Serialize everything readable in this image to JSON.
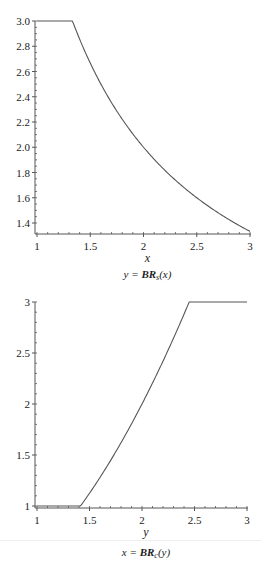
{
  "chart_data": [
    {
      "type": "line",
      "title": "",
      "caption_lhs": "y = ",
      "caption_fn": "BR",
      "caption_sub": "s",
      "caption_arg": "(x)",
      "xlabel": "x",
      "ylabel": "",
      "xlim": [
        1,
        3
      ],
      "ylim": [
        1.333,
        3.0
      ],
      "xticks": [
        "1",
        "1.5",
        "2",
        "2.5",
        "3"
      ],
      "yticks": [
        "3.0",
        "2.8",
        "2.6",
        "2.4",
        "2.2",
        "2.0",
        "1.8",
        "1.6",
        "1.4"
      ],
      "series": [
        {
          "name": "BR_s(x)",
          "x": [
            1.0,
            1.333,
            1.5,
            1.75,
            2.0,
            2.25,
            2.5,
            2.75,
            3.0
          ],
          "values": [
            3.0,
            3.0,
            2.667,
            2.286,
            2.0,
            1.778,
            1.6,
            1.455,
            1.333
          ]
        }
      ],
      "grid": false,
      "legend": "none"
    },
    {
      "type": "line",
      "title": "",
      "caption_lhs": "x = ",
      "caption_fn": "BR",
      "caption_sub": "c",
      "caption_arg": "(y)",
      "xlabel": "y",
      "ylabel": "",
      "xlim": [
        1,
        3
      ],
      "ylim": [
        1,
        3
      ],
      "xticks": [
        "1",
        "1.5",
        "2",
        "2.5",
        "3"
      ],
      "yticks": [
        "3",
        "2.5",
        "2",
        "1.5",
        "1"
      ],
      "series": [
        {
          "name": "BR_c(y)",
          "x": [
            1.0,
            1.414,
            1.6,
            1.8,
            2.0,
            2.2,
            2.449,
            3.0
          ],
          "values": [
            1.0,
            1.0,
            1.28,
            1.62,
            2.0,
            2.42,
            3.0,
            3.0
          ]
        }
      ],
      "grid": false,
      "legend": "none"
    }
  ]
}
